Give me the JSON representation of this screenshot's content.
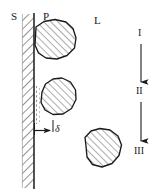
{
  "figure": {
    "width": 163,
    "height": 196,
    "background_color": "#ffffff",
    "line_color": "#1a1a1a",
    "hatch_color": "#555555"
  },
  "labels": {
    "solid": "S",
    "particle": "P",
    "liquid": "L",
    "boundary_layer_thickness": "δ",
    "stage_1": "I",
    "stage_2": "II",
    "stage_3": "III"
  },
  "regions": [
    {
      "name": "solid-wall",
      "label": "S",
      "description": "hatched vertical band representing the solid substrate",
      "x": 22,
      "y": 14,
      "width": 12,
      "height": 174
    },
    {
      "name": "liquid-bulk",
      "label": "L",
      "description": "open region to the right of the wall representing the liquid phase"
    }
  ],
  "particles": [
    {
      "name": "particle-attached-top",
      "label": "P",
      "state": "attached to wall",
      "cx": 55,
      "cy": 42,
      "r": 20
    },
    {
      "name": "particle-near-wall",
      "label": "P",
      "state": "within boundary layer",
      "cx": 58,
      "cy": 98,
      "r": 19
    },
    {
      "name": "particle-in-bulk",
      "label": "P",
      "state": "suspended in liquid",
      "cx": 103,
      "cy": 152,
      "r": 20
    }
  ],
  "annotations": {
    "delta_dimension": {
      "name": "boundary-layer-dimension",
      "symbol": "δ",
      "from_x": 34,
      "to_x": 53,
      "y": 130
    },
    "boundary_layer_edge": {
      "name": "boundary-layer-dashed-edge",
      "x": 36,
      "y_top": 86,
      "y_bottom": 124,
      "style": "dashed"
    }
  },
  "stage_sequence": {
    "name": "stage-arrow-sequence",
    "orientation": "vertical",
    "x": 141,
    "steps": [
      "I",
      "II",
      "III"
    ],
    "arrows": [
      {
        "name": "arrow-I-to-II",
        "from_y": 44,
        "to_y": 84
      },
      {
        "name": "arrow-II-to-III",
        "from_y": 102,
        "to_y": 143
      }
    ]
  }
}
